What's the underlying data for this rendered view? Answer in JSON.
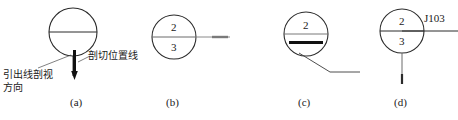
{
  "figure": {
    "stroke_color": "#2b2b2b",
    "thick_color": "#111111",
    "background": "#ffffff",
    "captions": [
      {
        "id": "a",
        "label": "(a)",
        "x": 78,
        "y": 100
      },
      {
        "id": "b",
        "label": "(b)",
        "x": 174,
        "y": 100
      },
      {
        "id": "c",
        "label": "(c)",
        "x": 306,
        "y": 100
      },
      {
        "id": "d",
        "label": "(d)",
        "x": 402,
        "y": 100
      }
    ],
    "annotations": {
      "cutting_plane_line": {
        "text": "剖切位置线",
        "x": 84,
        "y": 52
      },
      "leader_direction_line1": {
        "text": "引出线剖视",
        "x": 4,
        "y": 70
      },
      "leader_direction_line2": {
        "text": "方向",
        "x": 4,
        "y": 82
      }
    },
    "symbols": [
      {
        "id": "a",
        "name": "section-symbol-plain",
        "circle": {
          "cx": 73,
          "cy": 32,
          "r": 24
        },
        "diameter_line": true,
        "numbers": [],
        "stem": {
          "x": 73,
          "y1": 56,
          "y2": 76
        },
        "cut_bar": {
          "x": 73,
          "y1": 50,
          "y2": 74,
          "width": 3
        },
        "arrow": {
          "x": 73,
          "y": 78,
          "direction": "down"
        },
        "leader": {
          "x1": 38,
          "y1": 68,
          "x2": 70,
          "y2": 56
        }
      },
      {
        "id": "b",
        "name": "section-symbol-numbered-right-leader",
        "circle": {
          "cx": 174,
          "cy": 37,
          "r": 22
        },
        "diameter_line": true,
        "numbers": [
          {
            "value": "2",
            "x": 174,
            "y": 28
          },
          {
            "value": "3",
            "x": 174,
            "y": 48
          }
        ],
        "leader": {
          "x1": 196,
          "y1": 37,
          "x2": 232,
          "y2": 37
        },
        "thick_tail": {
          "x1": 212,
          "y1": 37,
          "x2": 228,
          "y2": 37
        }
      },
      {
        "id": "c",
        "name": "section-symbol-thick-bar-diagonal-leader",
        "circle": {
          "cx": 306,
          "cy": 34,
          "r": 22
        },
        "diameter_line": true,
        "numbers": [
          {
            "value": "2",
            "x": 306,
            "y": 26
          }
        ],
        "thick_bar": {
          "x1": 289,
          "y1": 43,
          "x2": 323,
          "y2": 43
        },
        "leader_diagonal": {
          "x1": 300,
          "y1": 54,
          "x2": 330,
          "y2": 72
        },
        "leader_horizontal": {
          "x1": 330,
          "y1": 72,
          "x2": 360,
          "y2": 72
        }
      },
      {
        "id": "d",
        "name": "section-symbol-tagged",
        "circle": {
          "cx": 402,
          "cy": 31,
          "r": 22
        },
        "diameter_line": true,
        "numbers": [
          {
            "value": "2",
            "x": 402,
            "y": 22
          },
          {
            "value": "3",
            "x": 402,
            "y": 42
          }
        ],
        "tag": {
          "text": "J103",
          "x": 424,
          "y": 14
        },
        "leader_right": {
          "x1": 402,
          "y1": 31,
          "x2": 458,
          "y2": 31
        },
        "stem": {
          "x": 402,
          "y1": 53,
          "y2": 84
        },
        "stem_tick": {
          "x": 402,
          "y1": 74,
          "y2": 84,
          "width": 2
        }
      }
    ]
  }
}
